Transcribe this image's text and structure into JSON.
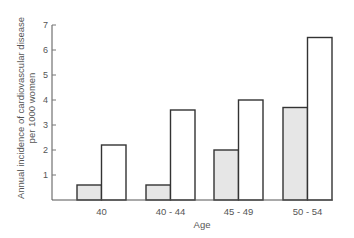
{
  "chart_data": {
    "type": "bar",
    "title": "",
    "xlabel": "Age",
    "ylabel_lines": [
      "Annual incidence of cardiovascular disease",
      "per 1000 women"
    ],
    "ylabel": "Annual incidence of cardiovascular disease per 1000 women",
    "categories": [
      "40",
      "40-44",
      "45-49",
      "50-54"
    ],
    "category_labels_display": [
      "40",
      "40 - 44",
      "45 - 49",
      "50 - 54"
    ],
    "series": [
      {
        "name": "shaded",
        "fill": "#e6e6e6",
        "values": [
          0.6,
          0.6,
          2.0,
          3.7
        ]
      },
      {
        "name": "open",
        "fill": "#ffffff",
        "values": [
          2.2,
          3.6,
          4.0,
          6.5
        ]
      }
    ],
    "ylim": [
      0,
      7
    ],
    "yticks": [
      1,
      2,
      3,
      4,
      5,
      6,
      7
    ],
    "grid": false,
    "legend": null
  }
}
